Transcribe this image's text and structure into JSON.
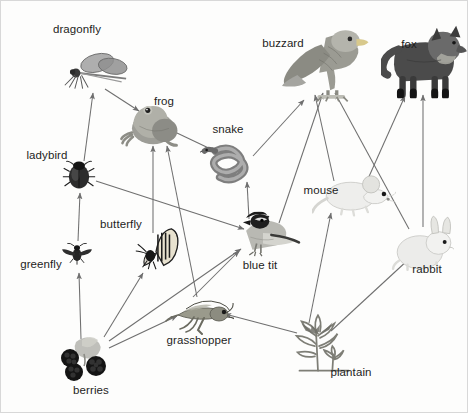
{
  "diagram": {
    "type": "food-web",
    "width": 468,
    "height": 413,
    "background_color": "#fdfdfc",
    "border_color": "#d8d8d8",
    "label_color": "#1d1d1d",
    "arrow_color": "#6f6f6f"
  },
  "nodes": [
    {
      "id": "dragonfly",
      "label": "dragonfly",
      "art": "dragonfly",
      "x": 95,
      "y": 72,
      "label_x": 76,
      "label_y": 29
    },
    {
      "id": "frog",
      "label": "frog",
      "art": "frog",
      "x": 150,
      "y": 121,
      "label_x": 163,
      "label_y": 101
    },
    {
      "id": "snake",
      "label": "snake",
      "art": "snake",
      "x": 235,
      "y": 162,
      "label_x": 227,
      "label_y": 129
    },
    {
      "id": "buzzard",
      "label": "buzzard",
      "art": "buzzard",
      "x": 327,
      "y": 62,
      "label_x": 282,
      "label_y": 43
    },
    {
      "id": "fox",
      "label": "fox",
      "art": "fox",
      "x": 423,
      "y": 60,
      "label_x": 408,
      "label_y": 44
    },
    {
      "id": "mouse",
      "label": "mouse",
      "art": "mouse",
      "x": 353,
      "y": 193,
      "label_x": 320,
      "label_y": 190
    },
    {
      "id": "rabbit",
      "label": "rabbit",
      "art": "rabbit",
      "x": 422,
      "y": 243,
      "label_x": 426,
      "label_y": 269
    },
    {
      "id": "ladybird",
      "label": "ladybird",
      "art": "ladybird",
      "x": 78,
      "y": 174,
      "label_x": 46,
      "label_y": 155
    },
    {
      "id": "butterfly",
      "label": "butterfly",
      "art": "butterfly",
      "x": 155,
      "y": 248,
      "label_x": 120,
      "label_y": 224
    },
    {
      "id": "blue-tit",
      "label": "blue tit",
      "art": "bluetit",
      "x": 262,
      "y": 234,
      "label_x": 259,
      "label_y": 265
    },
    {
      "id": "greenfly",
      "label": "greenfly",
      "art": "greenfly",
      "x": 76,
      "y": 253,
      "label_x": 40,
      "label_y": 264
    },
    {
      "id": "grasshopper",
      "label": "grasshopper",
      "art": "grasshopper",
      "x": 198,
      "y": 313,
      "label_x": 198,
      "label_y": 340
    },
    {
      "id": "berries",
      "label": "berries",
      "art": "berries",
      "x": 84,
      "y": 357,
      "label_x": 90,
      "label_y": 390
    },
    {
      "id": "plantain",
      "label": "plantain",
      "art": "plantain",
      "x": 318,
      "y": 342,
      "label_x": 350,
      "label_y": 372
    }
  ],
  "edges": [
    {
      "from": "berries",
      "to": "greenfly",
      "x1": 80,
      "y1": 338,
      "x2": 78,
      "y2": 272
    },
    {
      "from": "berries",
      "to": "butterfly",
      "x1": 103,
      "y1": 336,
      "x2": 142,
      "y2": 272
    },
    {
      "from": "berries",
      "to": "grasshopper",
      "x1": 108,
      "y1": 347,
      "x2": 176,
      "y2": 315
    },
    {
      "from": "berries",
      "to": "blue-tit",
      "x1": 108,
      "y1": 340,
      "x2": 240,
      "y2": 248
    },
    {
      "from": "plantain",
      "to": "grasshopper",
      "x1": 296,
      "y1": 332,
      "x2": 224,
      "y2": 313
    },
    {
      "from": "plantain",
      "to": "mouse",
      "x1": 308,
      "y1": 322,
      "x2": 330,
      "y2": 212
    },
    {
      "from": "plantain",
      "to": "rabbit",
      "x1": 330,
      "y1": 330,
      "x2": 408,
      "y2": 258
    },
    {
      "from": "greenfly",
      "to": "ladybird",
      "x1": 77,
      "y1": 240,
      "x2": 79,
      "y2": 192
    },
    {
      "from": "ladybird",
      "to": "dragonfly",
      "x1": 83,
      "y1": 160,
      "x2": 92,
      "y2": 92
    },
    {
      "from": "ladybird",
      "to": "blue-tit",
      "x1": 95,
      "y1": 180,
      "x2": 243,
      "y2": 228
    },
    {
      "from": "dragonfly",
      "to": "frog",
      "x1": 104,
      "y1": 88,
      "x2": 138,
      "y2": 110
    },
    {
      "from": "butterfly",
      "to": "frog",
      "x1": 152,
      "y1": 232,
      "x2": 152,
      "y2": 145
    },
    {
      "from": "grasshopper",
      "to": "frog",
      "x1": 196,
      "y1": 296,
      "x2": 166,
      "y2": 145
    },
    {
      "from": "grasshopper",
      "to": "blue-tit",
      "x1": 192,
      "y1": 296,
      "x2": 238,
      "y2": 250
    },
    {
      "from": "frog",
      "to": "snake",
      "x1": 176,
      "y1": 132,
      "x2": 216,
      "y2": 151
    },
    {
      "from": "blue-tit",
      "to": "snake",
      "x1": 248,
      "y1": 218,
      "x2": 246,
      "y2": 181
    },
    {
      "from": "blue-tit",
      "to": "buzzard",
      "x1": 278,
      "y1": 222,
      "x2": 322,
      "y2": 92
    },
    {
      "from": "snake",
      "to": "buzzard",
      "x1": 252,
      "y1": 155,
      "x2": 303,
      "y2": 99
    },
    {
      "from": "mouse",
      "to": "buzzard",
      "x1": 333,
      "y1": 180,
      "x2": 314,
      "y2": 94
    },
    {
      "from": "mouse",
      "to": "fox",
      "x1": 366,
      "y1": 180,
      "x2": 404,
      "y2": 95
    },
    {
      "from": "rabbit",
      "to": "buzzard",
      "x1": 408,
      "y1": 228,
      "x2": 334,
      "y2": 92
    },
    {
      "from": "rabbit",
      "to": "fox",
      "x1": 422,
      "y1": 226,
      "x2": 422,
      "y2": 94
    }
  ]
}
